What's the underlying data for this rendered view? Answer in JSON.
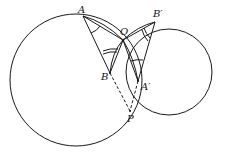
{
  "diagram": {
    "type": "geometry",
    "points": {
      "A": {
        "label": "A",
        "x": 83,
        "y": 16
      },
      "B_prime": {
        "label": "B′",
        "x": 155,
        "y": 22
      },
      "O": {
        "label": "O",
        "x": 123,
        "y": 40
      },
      "B": {
        "label": "B",
        "x": 110,
        "y": 73
      },
      "A_prime": {
        "label": "A′",
        "x": 138,
        "y": 81
      },
      "P": {
        "label": "P",
        "x": 130,
        "y": 111
      }
    },
    "circles": [
      {
        "name": "left-circle",
        "cx": 76,
        "cy": 80,
        "r": 66
      },
      {
        "name": "right-circle",
        "cx": 169,
        "cy": 72,
        "r": 43
      }
    ],
    "line_color": "#1a1a1a"
  }
}
